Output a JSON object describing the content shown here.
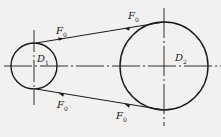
{
  "diagram": {
    "type": "belt-drive",
    "stroke_color": "#1a1a1a",
    "background": "#f2f1ef",
    "pulleys": [
      {
        "id": "small",
        "label": "D",
        "subscript": "1",
        "cx": 34,
        "cy": 66,
        "r": 23
      },
      {
        "id": "large",
        "label": "D",
        "subscript": "2",
        "cx": 164,
        "cy": 66,
        "r": 44
      }
    ],
    "forces": [
      {
        "label": "F",
        "subscript": "0",
        "position": "top-left"
      },
      {
        "label": "F",
        "subscript": "0",
        "position": "top-right"
      },
      {
        "label": "F",
        "subscript": "0",
        "position": "bottom-left"
      },
      {
        "label": "F",
        "subscript": "0",
        "position": "bottom-right"
      }
    ]
  }
}
